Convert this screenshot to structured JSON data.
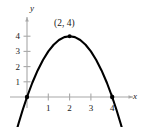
{
  "chart_data": {
    "type": "line",
    "title": "",
    "subtitle": "",
    "xlabel": "x",
    "ylabel": "y",
    "xlim": [
      -0.85,
      5.6
    ],
    "ylim": [
      -1.5,
      5.2
    ],
    "grid": false,
    "legend": null,
    "curve": {
      "name": "parabola",
      "equation": "y = -x^2 + 4x",
      "orientation": "opens-downward",
      "color": "#000000",
      "line_width": 2.1,
      "x": [
        -0.55,
        -0.4,
        -0.2,
        0,
        0.25,
        0.5,
        0.75,
        1,
        1.25,
        1.5,
        1.75,
        2,
        2.25,
        2.5,
        2.75,
        3,
        3.25,
        3.5,
        3.75,
        4,
        4.2,
        4.4,
        4.55
      ],
      "y": [
        -2.5,
        -1.76,
        -0.84,
        0,
        0.9375,
        1.75,
        2.4375,
        3,
        3.4375,
        3.75,
        3.9375,
        4,
        3.9375,
        3.75,
        3.4375,
        3,
        2.4375,
        1.75,
        0.9375,
        0,
        -0.84,
        -1.76,
        -2.5
      ]
    },
    "points": [
      {
        "label": "(2, 4)",
        "x": 2,
        "y": 4,
        "marked": true,
        "label_shown": true
      },
      {
        "label": "",
        "x": 0,
        "y": 0,
        "marked": true,
        "label_shown": false
      },
      {
        "label": "",
        "x": 4,
        "y": 0,
        "marked": true,
        "label_shown": false
      }
    ],
    "x_ticks": [
      {
        "value": 1,
        "label": "1"
      },
      {
        "value": 2,
        "label": "2"
      },
      {
        "value": 3,
        "label": "3"
      },
      {
        "value": 4,
        "label": "4"
      }
    ],
    "y_ticks": [
      {
        "value": 1,
        "label": "1"
      },
      {
        "value": 2,
        "label": "2"
      },
      {
        "value": 3,
        "label": "3"
      },
      {
        "value": 4,
        "label": "4"
      }
    ],
    "axis_color": "#a8a8a8",
    "text_color": "#1a1a1a"
  },
  "labels": {
    "vertex": "(2, 4)",
    "x_axis": "x",
    "y_axis": "y",
    "x_tick_1": "1",
    "x_tick_2": "2",
    "x_tick_3": "3",
    "x_tick_4": "4",
    "y_tick_1": "1",
    "y_tick_2": "2",
    "y_tick_3": "3",
    "y_tick_4": "4"
  }
}
